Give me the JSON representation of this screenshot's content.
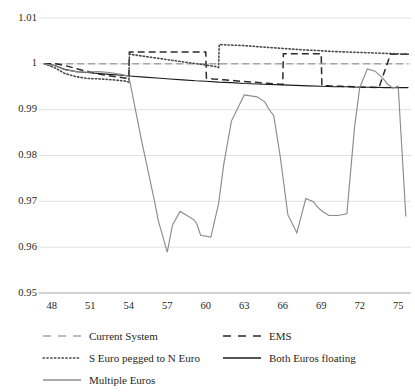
{
  "chart_data": {
    "type": "line",
    "title": "",
    "xlabel": "",
    "ylabel": "",
    "xlim": [
      47,
      76
    ],
    "ylim": [
      0.95,
      1.01
    ],
    "ytick_labels": [
      "1.01",
      "1",
      "0.99",
      "0.98",
      "0.97",
      "0.96",
      "0.95"
    ],
    "ytick_values": [
      1.01,
      1.0,
      0.99,
      0.98,
      0.97,
      0.96,
      0.95
    ],
    "xtick_labels": [
      "48",
      "51",
      "54",
      "57",
      "60",
      "63",
      "66",
      "69",
      "72",
      "75"
    ],
    "xtick_values": [
      48,
      51,
      54,
      57,
      60,
      63,
      66,
      69,
      72,
      75
    ],
    "grid": true,
    "legend_position": "bottom",
    "series": [
      {
        "name": "Current System",
        "style": "dashed",
        "color": "#a6a6a6",
        "x": [
          47.4,
          75.8
        ],
        "values": [
          1.0,
          1.0
        ]
      },
      {
        "name": "EMS",
        "style": "dashed",
        "color": "#2b2b2b",
        "x": [
          47.4,
          48.3,
          49.2,
          50.1,
          51.0,
          52.0,
          53.0,
          54.0,
          54.05,
          54.6,
          55.4,
          56.2,
          57.2,
          58.2,
          59.2,
          60.0,
          60.05,
          60.6,
          61.4,
          62.3,
          63.2,
          64.1,
          65.0,
          66.0,
          66.05,
          66.6,
          67.4,
          68.2,
          69.0,
          69.05,
          69.6,
          70.5,
          71.5,
          72.5,
          73.5,
          74.4,
          75.3,
          75.8
        ],
        "values": [
          1.0,
          1.0,
          0.9995,
          0.9988,
          0.9982,
          0.9976,
          0.9972,
          0.9968,
          1.0026,
          1.0026,
          1.0026,
          1.0026,
          1.0026,
          1.0026,
          1.0026,
          1.0026,
          0.9969,
          0.9967,
          0.9965,
          0.9963,
          0.9961,
          0.9959,
          0.9957,
          0.9955,
          1.0022,
          1.0022,
          1.0022,
          1.0022,
          1.0022,
          0.9953,
          0.9952,
          0.9951,
          0.995,
          0.9949,
          0.9948,
          1.0021,
          1.0021,
          1.0021
        ]
      },
      {
        "name": "S Euro pegged to N Euro",
        "style": "dotted",
        "color": "#4a4a4a",
        "x": [
          47.4,
          48.2,
          49.0,
          49.9,
          50.8,
          51.8,
          52.8,
          53.8,
          54.0,
          54.05,
          54.8,
          55.8,
          56.8,
          57.8,
          58.8,
          59.8,
          60.8,
          61.0,
          61.05,
          61.8,
          62.8,
          63.8,
          64.8,
          65.8,
          66.8,
          67.8,
          68.8,
          69.8,
          70.8,
          71.8,
          72.8,
          73.8,
          74.8,
          75.8
        ],
        "values": [
          1.0,
          0.9992,
          0.9979,
          0.9972,
          0.9968,
          0.9967,
          0.9965,
          0.9962,
          0.996,
          1.0021,
          1.0018,
          1.0014,
          1.001,
          1.0006,
          1.0002,
          0.9998,
          0.9994,
          0.9992,
          1.0042,
          1.0041,
          1.004,
          1.0038,
          1.0036,
          1.0034,
          1.0032,
          1.003,
          1.0029,
          1.0027,
          1.0026,
          1.0025,
          1.0024,
          1.0023,
          1.0022,
          1.0021
        ]
      },
      {
        "name": "Both Euros floating",
        "style": "solid",
        "color": "#1a1a1a",
        "x": [
          47.4,
          48.2,
          49.0,
          49.9,
          50.7,
          51.6,
          52.5,
          53.4,
          54.3,
          55.2,
          56.2,
          57.2,
          58.2,
          59.2,
          60.0,
          61.0,
          62.0,
          63.0,
          64.0,
          65.0,
          66.0,
          67.0,
          68.0,
          69.0,
          70.0,
          71.0,
          72.0,
          73.0,
          74.0,
          75.0,
          75.8
        ],
        "values": [
          1.0,
          0.9997,
          0.9988,
          0.9983,
          0.9981,
          0.9979,
          0.9977,
          0.9975,
          0.9973,
          0.9971,
          0.9969,
          0.9967,
          0.9965,
          0.9963,
          0.9962,
          0.996,
          0.9959,
          0.9957,
          0.9956,
          0.9955,
          0.9954,
          0.9953,
          0.9952,
          0.9951,
          0.995,
          0.995,
          0.9949,
          0.9949,
          0.9948,
          0.9948,
          0.9948
        ]
      },
      {
        "name": "Multiple Euros",
        "style": "solid",
        "color": "#8c8c8c",
        "x": [
          47.4,
          48.2,
          49.0,
          49.9,
          50.7,
          51.6,
          52.5,
          53.4,
          54.0,
          54.2,
          55.0,
          56.0,
          56.3,
          57.0,
          57.4,
          58.0,
          58.6,
          59.1,
          59.3,
          59.6,
          60.4,
          61.0,
          61.4,
          62.0,
          63.0,
          64.0,
          64.6,
          64.9,
          65.3,
          65.8,
          66.4,
          67.1,
          67.8,
          68.4,
          68.7,
          69.1,
          69.6,
          70.3,
          71.0,
          71.6,
          72.0,
          72.6,
          73.2,
          73.8,
          74.2,
          74.6,
          75.0,
          75.6
        ],
        "values": [
          1.0,
          0.9996,
          0.9987,
          0.9983,
          0.9982,
          0.9983,
          0.9981,
          0.9977,
          0.9973,
          0.9945,
          0.9832,
          0.9701,
          0.9658,
          0.9589,
          0.9648,
          0.9678,
          0.9668,
          0.9659,
          0.9651,
          0.9626,
          0.9622,
          0.9695,
          0.978,
          0.9875,
          0.9932,
          0.9928,
          0.9917,
          0.9902,
          0.9887,
          0.9799,
          0.9671,
          0.9631,
          0.9706,
          0.9699,
          0.9688,
          0.9678,
          0.9669,
          0.9669,
          0.9673,
          0.9862,
          0.9948,
          0.9989,
          0.9984,
          0.9969,
          0.9955,
          0.9947,
          0.9951,
          0.9667
        ]
      }
    ]
  },
  "legend": {
    "items": [
      {
        "label": "Current System",
        "style": "dashed",
        "color": "#a6a6a6",
        "col": 0,
        "row": 0
      },
      {
        "label": "EMS",
        "style": "dashed",
        "color": "#2b2b2b",
        "col": 1,
        "row": 0
      },
      {
        "label": "S Euro pegged to N Euro",
        "style": "dotted",
        "color": "#4a4a4a",
        "col": 0,
        "row": 1
      },
      {
        "label": "Both Euros floating",
        "style": "solid",
        "color": "#1a1a1a",
        "col": 1,
        "row": 1
      },
      {
        "label": "Multiple Euros",
        "style": "solid",
        "color": "#8c8c8c",
        "col": 0,
        "row": 2
      }
    ]
  },
  "axis_colors": {
    "grid": "#d9d9d9",
    "axis": "#a6a6a6",
    "text": "#231f20"
  }
}
